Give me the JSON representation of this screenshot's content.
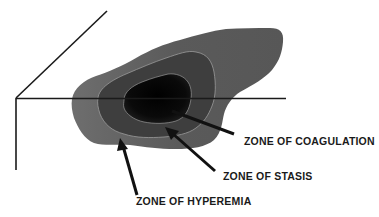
{
  "diagram": {
    "zones": [
      {
        "id": "coagulation",
        "label": "ZONE OF COAGULATION",
        "shade": "#0d0d0d"
      },
      {
        "id": "stasis",
        "label": "ZONE OF STASIS",
        "shade": "#3a3a3a"
      },
      {
        "id": "hyperemia",
        "label": "ZONE OF HYPEREMIA",
        "shade": "#5a5a5a"
      }
    ],
    "outer_zone_shade": "#5e5e5e",
    "boundary_line_color": "#9a9a9a",
    "axis_color": "#1a1a1a",
    "arrow_color": "#111111"
  }
}
